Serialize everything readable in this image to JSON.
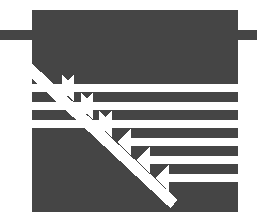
{
  "graphic": {
    "title": "Crossing Arrows Logo Mark",
    "type": "abstract-logo",
    "canvas": {
      "width": 257,
      "height": 219,
      "background_color": "#ffffff"
    },
    "colors": {
      "ink": "#454545",
      "paper": "#ffffff"
    },
    "block": {
      "name": "main-dark-block",
      "x": 32,
      "y": 10,
      "width": 206,
      "height": 202,
      "fill": "#454545"
    },
    "side_bars": [
      {
        "name": "left-connector-bar",
        "x": 0,
        "y": 30,
        "width": 34,
        "height": 10,
        "fill": "#454545"
      },
      {
        "name": "right-connector-bar",
        "x": 236,
        "y": 30,
        "width": 21,
        "height": 10,
        "fill": "#454545"
      }
    ],
    "diagonal": {
      "name": "diagonal-cut",
      "description": "white diagonal band descending left-to-right through the block",
      "from_x": 32,
      "from_y": 72,
      "to_x": 160,
      "to_y": 190
    },
    "arrows_right": [
      {
        "id": "r1",
        "y": 88,
        "tail_x": 32,
        "tip_x": 76,
        "thickness": 8,
        "head": 9,
        "direction": "right"
      },
      {
        "id": "r2",
        "y": 106,
        "tail_x": 32,
        "tip_x": 95,
        "thickness": 8,
        "head": 9,
        "direction": "right"
      },
      {
        "id": "r3",
        "y": 124,
        "tail_x": 32,
        "tip_x": 113,
        "thickness": 8,
        "head": 9,
        "direction": "right"
      }
    ],
    "arrows_left": [
      {
        "id": "l1",
        "y": 88,
        "tip_x": 60,
        "tail_x": 238,
        "thickness": 8,
        "head": 9,
        "direction": "left"
      },
      {
        "id": "l2",
        "y": 106,
        "tip_x": 79,
        "tail_x": 238,
        "thickness": 8,
        "head": 9,
        "direction": "left"
      },
      {
        "id": "l3",
        "y": 124,
        "tip_x": 98,
        "tail_x": 238,
        "thickness": 8,
        "head": 9,
        "direction": "left"
      },
      {
        "id": "l4",
        "y": 142,
        "tip_x": 117,
        "tail_x": 238,
        "thickness": 8,
        "head": 9,
        "direction": "left"
      },
      {
        "id": "l5",
        "y": 160,
        "tip_x": 136,
        "tail_x": 238,
        "thickness": 8,
        "head": 9,
        "direction": "left"
      },
      {
        "id": "l6",
        "y": 178,
        "tip_x": 155,
        "tail_x": 238,
        "thickness": 8,
        "head": 9,
        "direction": "left"
      }
    ],
    "stripe_count": 9,
    "arrow_count_right": 3,
    "arrow_count_left": 6
  }
}
